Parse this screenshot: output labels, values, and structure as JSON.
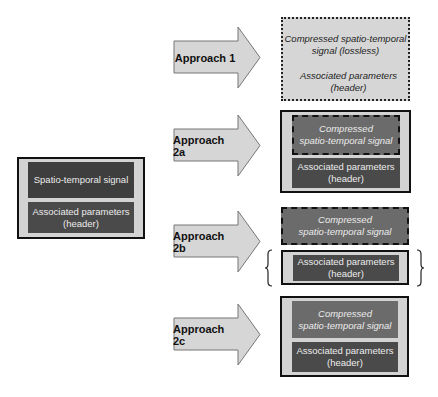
{
  "source": {
    "signal_label": "Spatio-temporal signal",
    "header_label_line1": "Associated parameters",
    "header_label_line2": "(header)"
  },
  "approaches": [
    {
      "id": "approach-1",
      "label": "Approach 1",
      "signal_line1": "Compressed spatio-temporal",
      "signal_line2": "signal (lossless)",
      "header_line1": "Associated parameters",
      "header_line2": "(header)"
    },
    {
      "id": "approach-2a",
      "label": "Approach 2a",
      "signal_line1": "Compressed",
      "signal_line2": "spatio-temporal signal",
      "header_line1": "Associated parameters",
      "header_line2": "(header)"
    },
    {
      "id": "approach-2b",
      "label": "Approach 2b",
      "signal_line1": "Compressed",
      "signal_line2": "spatio-temporal signal",
      "header_line1": "Associated parameters",
      "header_line2": "(header)"
    },
    {
      "id": "approach-2c",
      "label": "Approach 2c",
      "signal_line1": "Compressed",
      "signal_line2": "spatio-temporal signal",
      "header_line1": "Associated parameters",
      "header_line2": "(header)"
    }
  ],
  "colors": {
    "outer_fill": "#d3d3d3",
    "signal_dark": "#3e3e3e",
    "signal_compressed": "#6b6b6b",
    "header_fill": "#4a4a4a",
    "arrow_fill": "#d6d6d6",
    "border": "#111111"
  }
}
